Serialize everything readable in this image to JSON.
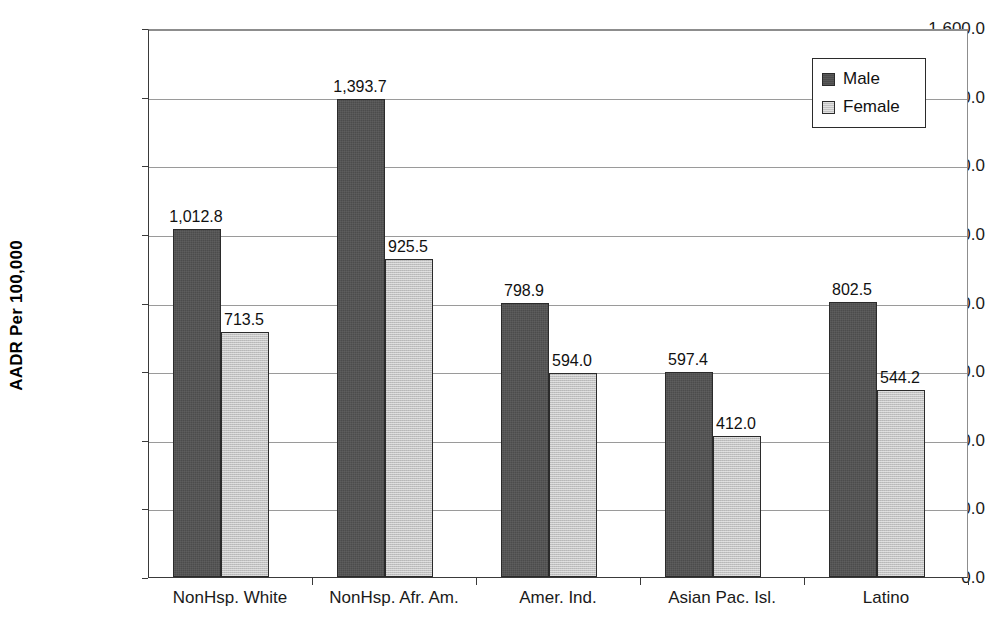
{
  "chart_data": {
    "type": "bar",
    "title": "",
    "subtitle": "",
    "xlabel": "",
    "ylabel": "AADR Per 100,000",
    "ylim": [
      0,
      1600
    ],
    "ytick_step": 200,
    "grid": true,
    "legend_position": "top-right",
    "categories": [
      "NonHsp. White",
      "NonHsp. Afr. Am.",
      "Amer. Ind.",
      "Asian Pac. Isl.",
      "Latino"
    ],
    "series": [
      {
        "name": "Male",
        "color": "#4c4c4c",
        "values": [
          1012.8,
          1393.7,
          798.9,
          597.4,
          802.5
        ],
        "labels": [
          "1,012.8",
          "1,393.7",
          "798.9",
          "597.4",
          "802.5"
        ]
      },
      {
        "name": "Female",
        "color": "#c2c2c2",
        "values": [
          713.5,
          925.5,
          594.0,
          412.0,
          544.2
        ],
        "labels": [
          "713.5",
          "925.5",
          "594.0",
          "412.0",
          "544.2"
        ]
      }
    ],
    "ytick_labels": [
      "0.0",
      "200.0",
      "400.0",
      "600.0",
      "800.0",
      "1,000.0",
      "1,200.0",
      "1,400.0",
      "1,600.0"
    ],
    "ytick_values": [
      0,
      200,
      400,
      600,
      800,
      1000,
      1200,
      1400,
      1600
    ]
  },
  "legend": {
    "items": [
      {
        "label": "Male",
        "color": "#4c4c4c"
      },
      {
        "label": "Female",
        "color": "#c2c2c2"
      }
    ]
  },
  "axis": {
    "y_title": "AADR Per 100,000"
  }
}
